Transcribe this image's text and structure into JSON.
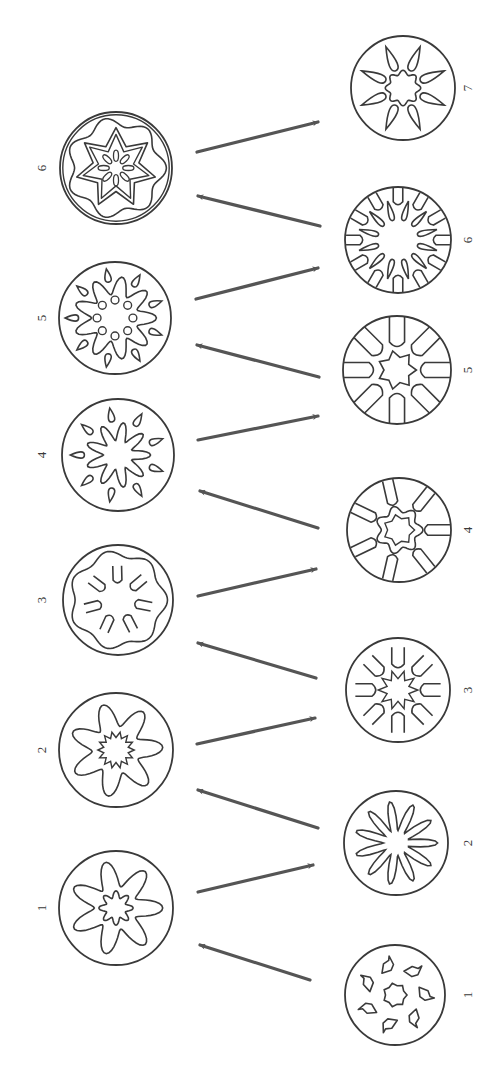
{
  "diagram": {
    "orientation": "rotated 90 degrees counter-clockwise; sequences read bottom to top",
    "colors": {
      "ink": "#3a3a3a",
      "arrow": "#555555",
      "background": "#ffffff"
    },
    "left_column": {
      "items": [
        {
          "label": "1",
          "cx": 116,
          "cy": 908,
          "r": 57,
          "motif": "seven wavy lobed petals around a small scalloped center ring"
        },
        {
          "label": "2",
          "cx": 116,
          "cy": 750,
          "r": 57,
          "motif": "seven rounded petal lobes around a spiky star center"
        },
        {
          "label": "3",
          "cx": 118,
          "cy": 600,
          "r": 55,
          "motif": "scalloped inner ring with seven U-shaped hooks"
        },
        {
          "label": "4",
          "cx": 118,
          "cy": 455,
          "r": 56,
          "motif": "wavy star with seven teardrops between the rays"
        },
        {
          "label": "5",
          "cx": 115,
          "cy": 318,
          "r": 56,
          "motif": "wavy star with outer teardrops and inner triangular dots"
        },
        {
          "label": "6",
          "cx": 116,
          "cy": 168,
          "r": 56,
          "motif": "seven-pointed star within wavy rings and elliptical inner dots"
        }
      ]
    },
    "right_column": {
      "items": [
        {
          "label": "1",
          "cx": 395,
          "cy": 995,
          "r": 50,
          "motif": "seven irregular blobs around a small star center"
        },
        {
          "label": "2",
          "cx": 396,
          "cy": 843,
          "r": 52,
          "motif": "ring of lobed petal shapes around an open center"
        },
        {
          "label": "3",
          "cx": 398,
          "cy": 690,
          "r": 52,
          "motif": "U-shaped lobes around a spiky star center"
        },
        {
          "label": "4",
          "cx": 399,
          "cy": 530,
          "r": 52,
          "motif": "U-shaped loops from the rim around a wavy star center"
        },
        {
          "label": "5",
          "cx": 397,
          "cy": 370,
          "r": 54,
          "motif": "U-shaped loops from the rim around a seven-pointed star"
        },
        {
          "label": "6",
          "cx": 398,
          "cy": 240,
          "r": 53,
          "motif": "radial teardrop loops along the rim around an open center"
        },
        {
          "label": "7",
          "cx": 403,
          "cy": 88,
          "r": 52,
          "motif": "seven heart-shaped tapered rays around a scalloped ring"
        }
      ]
    },
    "arrows": [
      {
        "from": "right-1",
        "to": "left-1",
        "x1": 310,
        "y1": 980,
        "x2": 200,
        "y2": 945
      },
      {
        "from": "left-1",
        "to": "right-2",
        "x1": 198,
        "y1": 892,
        "x2": 313,
        "y2": 865
      },
      {
        "from": "right-2",
        "to": "left-2",
        "x1": 318,
        "y1": 828,
        "x2": 198,
        "y2": 790
      },
      {
        "from": "left-2",
        "to": "right-3",
        "x1": 197,
        "y1": 744,
        "x2": 315,
        "y2": 718
      },
      {
        "from": "right-3",
        "to": "left-3",
        "x1": 316,
        "y1": 678,
        "x2": 198,
        "y2": 643
      },
      {
        "from": "left-3",
        "to": "right-4",
        "x1": 198,
        "y1": 596,
        "x2": 316,
        "y2": 569
      },
      {
        "from": "right-4",
        "to": "left-4",
        "x1": 318,
        "y1": 528,
        "x2": 200,
        "y2": 491
      },
      {
        "from": "left-4",
        "to": "right-5",
        "x1": 198,
        "y1": 440,
        "x2": 318,
        "y2": 416
      },
      {
        "from": "right-5",
        "to": "left-5",
        "x1": 319,
        "y1": 377,
        "x2": 197,
        "y2": 345
      },
      {
        "from": "left-5",
        "to": "right-6",
        "x1": 196,
        "y1": 299,
        "x2": 318,
        "y2": 268
      },
      {
        "from": "right-6",
        "to": "left-6",
        "x1": 320,
        "y1": 226,
        "x2": 198,
        "y2": 196
      },
      {
        "from": "left-6",
        "to": "right-7",
        "x1": 197,
        "y1": 152,
        "x2": 318,
        "y2": 122
      }
    ],
    "label_positions": {
      "left_x": 42,
      "right_x": 468
    }
  }
}
